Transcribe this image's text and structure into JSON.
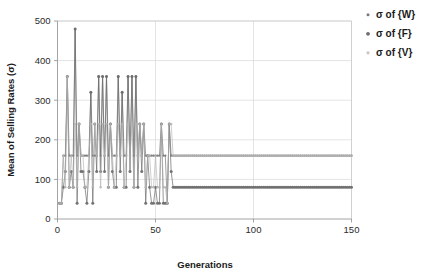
{
  "chart_data": {
    "type": "line",
    "title": "",
    "xlabel": "Generations",
    "ylabel": "Mean of Selling Rates (σ)",
    "xlim": [
      0,
      150
    ],
    "ylim": [
      0,
      500
    ],
    "xticks": [
      0,
      50,
      100,
      150
    ],
    "yticks": [
      0,
      100,
      200,
      300,
      400,
      500
    ],
    "grid": true,
    "legend_position": "top-right",
    "series": [
      {
        "name": "σ of {W}",
        "color": "#7a7a7a",
        "marker": "dot-small",
        "converged_value": 160,
        "x": [
          1,
          2,
          3,
          4,
          5,
          6,
          7,
          8,
          9,
          10,
          11,
          12,
          13,
          14,
          15,
          16,
          17,
          18,
          19,
          20,
          21,
          22,
          23,
          24,
          25,
          26,
          27,
          28,
          29,
          30,
          31,
          32,
          33,
          34,
          35,
          36,
          37,
          38,
          39,
          40,
          41,
          42,
          43,
          44,
          45,
          46,
          47,
          48,
          49,
          50,
          51,
          52,
          53,
          54,
          55,
          56,
          57,
          58,
          59,
          60,
          65,
          70,
          75,
          80,
          85,
          90,
          95,
          100,
          105,
          110,
          115,
          120,
          125,
          130,
          135,
          140,
          145,
          150
        ],
        "values": [
          40,
          40,
          160,
          160,
          360,
          160,
          160,
          160,
          480,
          160,
          240,
          160,
          160,
          160,
          160,
          160,
          320,
          160,
          160,
          160,
          360,
          160,
          360,
          160,
          360,
          160,
          240,
          160,
          160,
          160,
          360,
          160,
          320,
          160,
          160,
          360,
          160,
          360,
          160,
          360,
          160,
          240,
          160,
          240,
          160,
          160,
          160,
          160,
          160,
          160,
          160,
          160,
          240,
          160,
          160,
          40,
          240,
          160,
          160,
          160,
          160,
          160,
          160,
          160,
          160,
          160,
          160,
          160,
          160,
          160,
          160,
          160,
          160,
          160,
          160,
          160,
          160,
          160
        ]
      },
      {
        "name": "σ of {F}",
        "color": "#6e6e6e",
        "marker": "dot-medium",
        "converged_value": 80,
        "x": [
          1,
          2,
          3,
          4,
          5,
          6,
          7,
          8,
          9,
          10,
          11,
          12,
          13,
          14,
          15,
          16,
          17,
          18,
          19,
          20,
          21,
          22,
          23,
          24,
          25,
          26,
          27,
          28,
          29,
          30,
          31,
          32,
          33,
          34,
          35,
          36,
          37,
          38,
          39,
          40,
          41,
          42,
          43,
          44,
          45,
          46,
          47,
          48,
          49,
          50,
          51,
          52,
          53,
          54,
          55,
          56,
          57,
          58,
          59,
          60,
          65,
          70,
          75,
          80,
          85,
          90,
          95,
          100,
          105,
          110,
          115,
          120,
          125,
          130,
          135,
          140,
          145,
          150
        ],
        "values": [
          40,
          40,
          80,
          120,
          360,
          80,
          120,
          80,
          480,
          40,
          240,
          120,
          120,
          80,
          40,
          120,
          320,
          40,
          240,
          120,
          360,
          120,
          360,
          120,
          360,
          80,
          240,
          120,
          80,
          80,
          360,
          120,
          320,
          80,
          80,
          360,
          120,
          360,
          80,
          360,
          80,
          240,
          120,
          240,
          40,
          160,
          80,
          40,
          40,
          80,
          40,
          40,
          240,
          40,
          40,
          40,
          240,
          120,
          80,
          80,
          80,
          80,
          80,
          80,
          80,
          80,
          80,
          80,
          80,
          80,
          80,
          80,
          80,
          80,
          80,
          80,
          80,
          80
        ]
      },
      {
        "name": "σ of {V}",
        "color": "#b3b3b3",
        "marker": "dot-light",
        "converged_value": 160,
        "x": [
          1,
          2,
          3,
          4,
          5,
          6,
          7,
          8,
          9,
          10,
          11,
          12,
          13,
          14,
          15,
          16,
          17,
          18,
          19,
          20,
          21,
          22,
          23,
          24,
          25,
          26,
          27,
          28,
          29,
          30,
          31,
          32,
          33,
          34,
          35,
          36,
          37,
          38,
          39,
          40,
          41,
          42,
          43,
          44,
          45,
          46,
          47,
          48,
          49,
          50,
          51,
          52,
          53,
          54,
          55,
          56,
          57,
          58,
          59,
          60,
          65,
          70,
          75,
          80,
          85,
          90,
          95,
          100,
          105,
          110,
          115,
          120,
          125,
          130,
          135,
          140,
          145,
          150
        ],
        "values": [
          40,
          40,
          160,
          80,
          360,
          80,
          160,
          80,
          240,
          80,
          240,
          160,
          160,
          80,
          80,
          160,
          240,
          80,
          240,
          160,
          240,
          80,
          240,
          160,
          240,
          80,
          240,
          160,
          80,
          160,
          240,
          160,
          240,
          80,
          160,
          240,
          160,
          240,
          80,
          240,
          160,
          240,
          160,
          240,
          80,
          160,
          160,
          80,
          80,
          160,
          80,
          80,
          240,
          80,
          80,
          40,
          240,
          240,
          160,
          160,
          160,
          160,
          160,
          160,
          160,
          160,
          160,
          160,
          160,
          160,
          160,
          160,
          160,
          160,
          160,
          160,
          160,
          160
        ]
      }
    ]
  },
  "legend": {
    "items": [
      {
        "label": "σ of {W}"
      },
      {
        "label": "σ of {F}"
      },
      {
        "label": "σ of {V}"
      }
    ]
  },
  "axes": {
    "y_title": "Mean of Selling Rates (σ)",
    "x_title": "Generations",
    "y_tick_labels": [
      "0",
      "100",
      "200",
      "300",
      "400",
      "500"
    ],
    "x_tick_labels": [
      "0",
      "50",
      "100",
      "150"
    ]
  }
}
